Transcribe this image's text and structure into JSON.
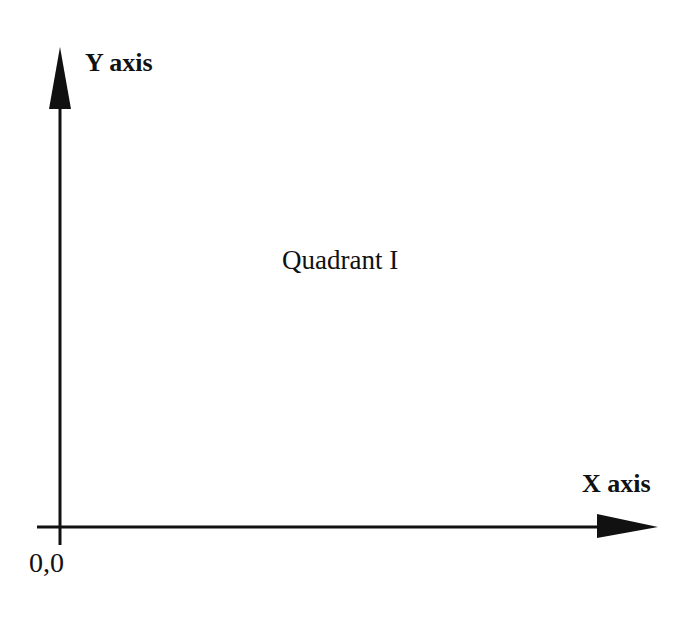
{
  "diagram": {
    "type": "cartesian-axes",
    "background_color": "#ffffff",
    "stroke_color": "#111111",
    "labels": {
      "y_axis": "Y axis",
      "x_axis": "X axis",
      "quadrant": "Quadrant I",
      "origin": "0,0"
    },
    "geometry": {
      "origin": {
        "x": 60,
        "y": 527
      },
      "y_axis": {
        "line_from": {
          "x": 60,
          "y": 108
        },
        "line_to": {
          "x": 60,
          "y": 545
        },
        "arrow_tip": {
          "x": 60,
          "y": 47
        },
        "arrow_base_left": {
          "x": 49,
          "y": 109
        },
        "arrow_base_right": {
          "x": 71,
          "y": 109
        }
      },
      "x_axis": {
        "line_from": {
          "x": 37,
          "y": 527
        },
        "line_to": {
          "x": 600,
          "y": 527
        },
        "arrow_tip": {
          "x": 658,
          "y": 527
        },
        "arrow_base_top": {
          "x": 597,
          "y": 514
        },
        "arrow_base_bottom": {
          "x": 597,
          "y": 538
        }
      },
      "line_width": 3
    }
  }
}
